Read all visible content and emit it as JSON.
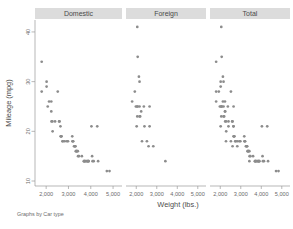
{
  "figure": {
    "background_color": "#ffffff",
    "marker_color": "#8c8c8c",
    "header_bar_color": "#dcdcdc",
    "axis_color": "#9a9a9a",
    "text_color": "#4d4d4d"
  },
  "note": "Graphs by Car type",
  "chart_data": {
    "type": "scatter",
    "title": "",
    "xlabel": "Weight (lbs.)",
    "ylabel": "Mileage (mpg)",
    "xlim": [
      1500,
      5400
    ],
    "ylim": [
      9,
      42
    ],
    "xticks": [
      2000,
      3000,
      4000,
      5000
    ],
    "xticklabels": [
      "2,000",
      "3,000",
      "4,000",
      "5,000"
    ],
    "yticks": [
      10,
      20,
      30,
      40
    ],
    "yticklabels": [
      "10",
      "20",
      "30",
      "40"
    ],
    "grid": false,
    "legend_position": "none",
    "facet_variable": "Car type",
    "panels": [
      {
        "label": "Domestic",
        "points": [
          [
            1800,
            34
          ],
          [
            1800,
            28
          ],
          [
            2020,
            30
          ],
          [
            2020,
            29
          ],
          [
            2070,
            25
          ],
          [
            2130,
            26
          ],
          [
            2230,
            26
          ],
          [
            2230,
            24
          ],
          [
            2240,
            22
          ],
          [
            2280,
            22
          ],
          [
            2290,
            20
          ],
          [
            2400,
            22
          ],
          [
            2520,
            28
          ],
          [
            2580,
            22
          ],
          [
            2600,
            22
          ],
          [
            2640,
            21
          ],
          [
            2650,
            19
          ],
          [
            2670,
            19
          ],
          [
            2690,
            19
          ],
          [
            2730,
            18
          ],
          [
            2750,
            18
          ],
          [
            2830,
            18
          ],
          [
            2930,
            18
          ],
          [
            2980,
            18
          ],
          [
            3170,
            19
          ],
          [
            3180,
            18
          ],
          [
            3200,
            18
          ],
          [
            3210,
            18
          ],
          [
            3250,
            17
          ],
          [
            3280,
            17
          ],
          [
            3300,
            17
          ],
          [
            3310,
            17
          ],
          [
            3330,
            16
          ],
          [
            3350,
            16
          ],
          [
            3370,
            16
          ],
          [
            3380,
            16
          ],
          [
            3420,
            16
          ],
          [
            3430,
            15
          ],
          [
            3470,
            15
          ],
          [
            3600,
            15
          ],
          [
            3690,
            14
          ],
          [
            3700,
            14
          ],
          [
            3720,
            14
          ],
          [
            3740,
            14
          ],
          [
            3780,
            14
          ],
          [
            3830,
            14
          ],
          [
            3850,
            14
          ],
          [
            3880,
            14
          ],
          [
            3900,
            14
          ],
          [
            3900,
            14
          ],
          [
            4030,
            21
          ],
          [
            4060,
            15
          ],
          [
            4080,
            14
          ],
          [
            4130,
            14
          ],
          [
            4290,
            21
          ],
          [
            4330,
            14
          ],
          [
            4720,
            12
          ],
          [
            4840,
            12
          ]
        ]
      },
      {
        "label": "Foreign",
        "points": [
          [
            2050,
            41
          ],
          [
            2070,
            35
          ],
          [
            2130,
            31
          ],
          [
            1930,
            28
          ],
          [
            2160,
            30
          ],
          [
            1800,
            26
          ],
          [
            1980,
            25
          ],
          [
            2040,
            25
          ],
          [
            2070,
            25
          ],
          [
            2160,
            25
          ],
          [
            2240,
            24
          ],
          [
            2050,
            23
          ],
          [
            2160,
            23
          ],
          [
            2190,
            23
          ],
          [
            2370,
            25
          ],
          [
            2650,
            25
          ],
          [
            2020,
            21
          ],
          [
            2400,
            21
          ],
          [
            2650,
            21
          ],
          [
            2280,
            18
          ],
          [
            2520,
            18
          ],
          [
            2600,
            17
          ],
          [
            2830,
            17
          ],
          [
            3420,
            14
          ]
        ]
      },
      {
        "label": "Total",
        "points": [
          [
            1800,
            34
          ],
          [
            1800,
            28
          ],
          [
            2020,
            30
          ],
          [
            2020,
            29
          ],
          [
            2070,
            25
          ],
          [
            2130,
            26
          ],
          [
            2230,
            26
          ],
          [
            2230,
            24
          ],
          [
            2240,
            22
          ],
          [
            2280,
            22
          ],
          [
            2290,
            20
          ],
          [
            2400,
            22
          ],
          [
            2520,
            28
          ],
          [
            2580,
            22
          ],
          [
            2600,
            22
          ],
          [
            2640,
            21
          ],
          [
            2650,
            19
          ],
          [
            2670,
            19
          ],
          [
            2690,
            19
          ],
          [
            2730,
            18
          ],
          [
            2750,
            18
          ],
          [
            2830,
            18
          ],
          [
            2930,
            18
          ],
          [
            2980,
            18
          ],
          [
            3170,
            19
          ],
          [
            3180,
            18
          ],
          [
            3200,
            18
          ],
          [
            3210,
            18
          ],
          [
            3250,
            17
          ],
          [
            3280,
            17
          ],
          [
            3300,
            17
          ],
          [
            3310,
            17
          ],
          [
            3330,
            16
          ],
          [
            3350,
            16
          ],
          [
            3370,
            16
          ],
          [
            3380,
            16
          ],
          [
            3420,
            16
          ],
          [
            3430,
            15
          ],
          [
            3470,
            15
          ],
          [
            3600,
            15
          ],
          [
            3690,
            14
          ],
          [
            3700,
            14
          ],
          [
            3720,
            14
          ],
          [
            3740,
            14
          ],
          [
            3780,
            14
          ],
          [
            3830,
            14
          ],
          [
            3850,
            14
          ],
          [
            3880,
            14
          ],
          [
            3900,
            14
          ],
          [
            3900,
            14
          ],
          [
            4030,
            21
          ],
          [
            4060,
            15
          ],
          [
            4080,
            14
          ],
          [
            4130,
            14
          ],
          [
            4290,
            21
          ],
          [
            4330,
            14
          ],
          [
            4720,
            12
          ],
          [
            4840,
            12
          ],
          [
            2050,
            41
          ],
          [
            2070,
            35
          ],
          [
            2130,
            31
          ],
          [
            1930,
            28
          ],
          [
            2160,
            30
          ],
          [
            1800,
            26
          ],
          [
            1980,
            25
          ],
          [
            2040,
            25
          ],
          [
            2070,
            25
          ],
          [
            2160,
            25
          ],
          [
            2240,
            24
          ],
          [
            2050,
            23
          ],
          [
            2160,
            23
          ],
          [
            2190,
            23
          ],
          [
            2370,
            25
          ],
          [
            2650,
            25
          ],
          [
            2020,
            21
          ],
          [
            2400,
            21
          ],
          [
            2650,
            21
          ],
          [
            2280,
            18
          ],
          [
            2520,
            18
          ],
          [
            2600,
            17
          ],
          [
            2830,
            17
          ],
          [
            3420,
            14
          ]
        ]
      }
    ]
  }
}
